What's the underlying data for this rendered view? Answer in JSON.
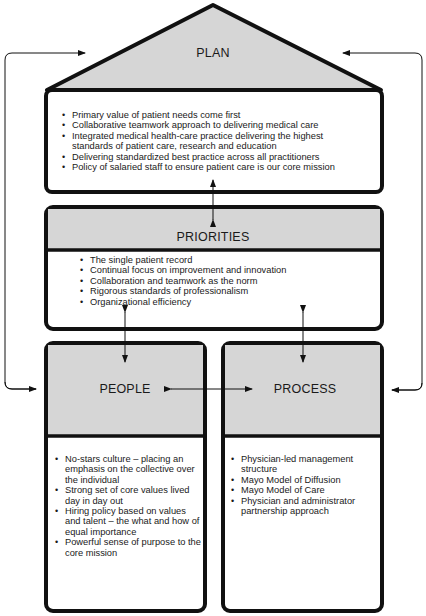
{
  "plan": {
    "title": "PLAN",
    "items": [
      "Primary value of patient needs come first",
      "Collaborative teamwork approach to delivering medical care",
      "Integrated medical health-care practice delivering the highest standards of patient care, research and education",
      "Delivering standardized best practice across all practitioners",
      "Policy of salaried staff to ensure patient care is our core mission"
    ]
  },
  "priorities": {
    "title": "PRIORITIES",
    "items": [
      "The single patient record",
      "Continual focus on improvement and innovation",
      "Collaboration and teamwork as the norm",
      "Rigorous standards of professionalism",
      "Organizational efficiency"
    ]
  },
  "people": {
    "title": "PEOPLE",
    "items": [
      "No-stars culture – placing an emphasis on the collective over the individual",
      "Strong set of core values lived day in day out",
      "Hiring policy based on values and talent – the what and how of equal importance",
      "Powerful sense of purpose to the core mission"
    ]
  },
  "process": {
    "title": "PROCESS",
    "items": [
      "Physician-led management structure",
      "Mayo Model of Diffusion",
      "Mayo Model of Care",
      "Physician and administrator partnership approach"
    ]
  },
  "colors": {
    "header_fill": "#d6d6d6",
    "stroke": "#111111"
  }
}
